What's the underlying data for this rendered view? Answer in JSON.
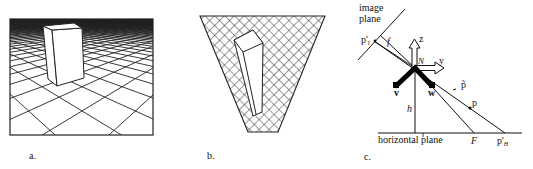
{
  "figure": {
    "panels": [
      {
        "id": "a",
        "caption": "a.",
        "description": "Rectangular block standing on a perspective grid ground plane"
      },
      {
        "id": "b",
        "caption": "b.",
        "description": "Inverse-perspective (bird's-eye) remapping of image: trapezoidal cross-hatched region with elongated block"
      },
      {
        "id": "c",
        "caption": "c.",
        "description": "Camera geometry diagram"
      }
    ],
    "diagram_c": {
      "labels": {
        "image_plane_line1": "image",
        "image_plane_line2": "plane",
        "p_prime_I": "p'",
        "p_prime_I_sub": "I",
        "focal": "f",
        "z_axis": "z",
        "y_axis": "y",
        "N": "N",
        "v_axis": "v",
        "w_axis": "w",
        "p_tilde": "p̃",
        "p": "p",
        "h": "h",
        "horizontal_plane": "horizontal plane",
        "F": "F",
        "p_prime_H": "p'",
        "p_prime_H_sub": "H"
      }
    }
  }
}
